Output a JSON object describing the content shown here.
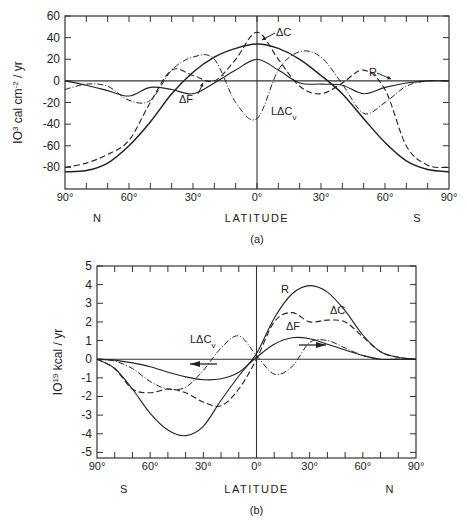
{
  "chart_data": [
    {
      "id": "a",
      "type": "line",
      "panel_label": "(a)",
      "ylabel": "10^3 cal cm^-2 / yr",
      "ylabel_parts": {
        "base": "IO",
        "exp": "3",
        "mid": " cal cm",
        "exp2": "-2",
        "tail": " / yr"
      },
      "xlabel": "LATITUDE",
      "x_left_hemisphere": "N",
      "x_right_hemisphere": "S",
      "x_ticks": [
        "90°",
        "60°",
        "30°",
        "0°",
        "30°",
        "60°",
        "90°"
      ],
      "y_ticks": [
        "60",
        "40",
        "20",
        "0",
        "-20",
        "-40",
        "-60",
        "-80"
      ],
      "ylim": [
        -100,
        60
      ],
      "xlim": [
        -90,
        90
      ],
      "x_note": "negative = N, positive = S",
      "annotations": [
        "ΔC",
        "ΔF",
        "R",
        "LΔCv"
      ],
      "series": [
        {
          "name": "R",
          "style": "solid-heavy",
          "x": [
            -90,
            -80,
            -70,
            -60,
            -50,
            -40,
            -30,
            -20,
            -10,
            0,
            10,
            20,
            30,
            40,
            50,
            60,
            70,
            80,
            90
          ],
          "y": [
            -84,
            -83,
            -76,
            -60,
            -38,
            -12,
            8,
            22,
            30,
            34,
            30,
            20,
            5,
            -12,
            -35,
            -57,
            -74,
            -82,
            -84
          ]
        },
        {
          "name": "ΔF",
          "style": "solid",
          "x": [
            -90,
            -80,
            -70,
            -60,
            -50,
            -40,
            -30,
            -20,
            -10,
            0,
            10,
            20,
            30,
            40,
            50,
            60,
            70,
            80,
            90
          ],
          "y": [
            0,
            -4,
            -9,
            -14,
            -6,
            -8,
            -12,
            -2,
            10,
            20,
            10,
            -2,
            -3,
            -4,
            -12,
            -6,
            -2,
            0,
            0
          ]
        },
        {
          "name": "ΔC",
          "style": "dashed",
          "x": [
            -90,
            -80,
            -70,
            -60,
            -50,
            -40,
            -30,
            -20,
            -10,
            0,
            10,
            20,
            30,
            40,
            50,
            60,
            70,
            80,
            90
          ],
          "y": [
            -80,
            -76,
            -68,
            -55,
            -20,
            10,
            5,
            0,
            20,
            45,
            20,
            -5,
            -12,
            -2,
            10,
            -8,
            -60,
            -78,
            -80
          ]
        },
        {
          "name": "LΔCv",
          "style": "dash-dot",
          "x": [
            -90,
            -80,
            -70,
            -60,
            -50,
            -40,
            -30,
            -20,
            -10,
            0,
            10,
            20,
            30,
            40,
            50,
            60,
            70,
            80,
            90
          ],
          "y": [
            -8,
            -3,
            -5,
            -18,
            -18,
            10,
            22,
            20,
            -20,
            -35,
            10,
            27,
            22,
            -3,
            -30,
            -20,
            -5,
            0,
            0
          ]
        }
      ]
    },
    {
      "id": "b",
      "type": "line",
      "panel_label": "(b)",
      "ylabel": "10^19 kcal / yr",
      "ylabel_parts": {
        "base": "IO",
        "exp": "19",
        "tail": " kcal / yr"
      },
      "xlabel": "LATITUDE",
      "x_left_hemisphere": "S",
      "x_right_hemisphere": "N",
      "x_ticks": [
        "90°",
        "60°",
        "30°",
        "0°",
        "30°",
        "60°",
        "90°"
      ],
      "y_ticks": [
        "5",
        "4",
        "3",
        "2",
        "1",
        "0",
        "-1",
        "-2",
        "-3",
        "-4",
        "-5"
      ],
      "ylim": [
        -5.3,
        5
      ],
      "xlim": [
        -90,
        90
      ],
      "x_note": "negative = S, positive = N",
      "annotations": [
        "R",
        "ΔC",
        "ΔF",
        "LΔCv"
      ],
      "series": [
        {
          "name": "R",
          "style": "solid",
          "x": [
            -90,
            -80,
            -70,
            -60,
            -50,
            -40,
            -30,
            -20,
            -10,
            0,
            10,
            20,
            30,
            40,
            50,
            60,
            70,
            80,
            90
          ],
          "y": [
            0,
            -0.5,
            -1.6,
            -2.9,
            -3.8,
            -4.1,
            -3.6,
            -2.2,
            -0.9,
            0.3,
            2.2,
            3.5,
            3.95,
            3.6,
            2.6,
            1.3,
            0.4,
            0.1,
            0
          ]
        },
        {
          "name": "ΔC",
          "style": "dashed",
          "x": [
            -90,
            -80,
            -70,
            -60,
            -50,
            -40,
            -30,
            -20,
            -10,
            0,
            10,
            20,
            30,
            40,
            50,
            60,
            70,
            80,
            90
          ],
          "y": [
            0,
            -0.5,
            -1.6,
            -1.8,
            -1.6,
            -1.8,
            -2.3,
            -2.5,
            -1.6,
            0,
            2.0,
            2.5,
            2.0,
            2.1,
            2.0,
            1.2,
            0.4,
            0.1,
            0
          ]
        },
        {
          "name": "ΔF",
          "style": "solid",
          "x": [
            -90,
            -80,
            -70,
            -60,
            -50,
            -40,
            -30,
            -20,
            -10,
            0,
            10,
            20,
            30,
            40,
            50,
            60,
            70,
            80,
            90
          ],
          "y": [
            0,
            -0.05,
            -0.2,
            -0.4,
            -0.7,
            -0.95,
            -1.1,
            -1.05,
            -0.7,
            0.1,
            0.8,
            1.15,
            1.1,
            0.8,
            0.5,
            0.2,
            0,
            0,
            0
          ]
        },
        {
          "name": "LΔCv",
          "style": "dash-dot",
          "x": [
            -90,
            -80,
            -70,
            -60,
            -50,
            -40,
            -30,
            -20,
            -10,
            0,
            10,
            20,
            30,
            40,
            50,
            60,
            70,
            80,
            90
          ],
          "y": [
            0,
            -0.1,
            -0.5,
            -1.2,
            -1.6,
            -1.5,
            -0.6,
            0.6,
            1.25,
            0.2,
            -0.8,
            -0.4,
            0.9,
            1.0,
            0.6,
            0.2,
            0,
            0,
            0
          ]
        }
      ]
    }
  ]
}
